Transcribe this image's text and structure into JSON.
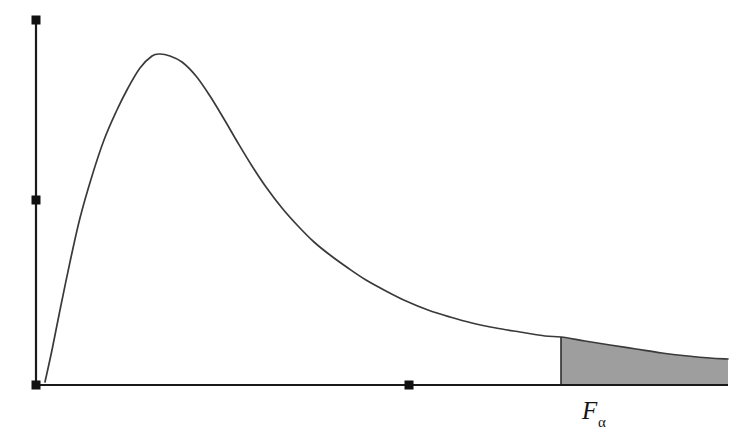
{
  "figure": {
    "name": "f-distribution-critical-region",
    "background_color": "#ffffff",
    "axis_color": "#1a1a1a",
    "curve_color": "#3a3a3a",
    "shade_color": "#9e9e9e"
  },
  "labels": {
    "critical_value_symbol": "F",
    "critical_value_subscript": "α"
  },
  "chart_data": {
    "type": "line",
    "title": "",
    "xlabel": "",
    "ylabel": "",
    "grid": false,
    "legend": null,
    "xlim": [
      0,
      692
    ],
    "ylim": [
      0,
      365
    ],
    "axis_markers": {
      "y_axis": [
        {
          "name": "y-axis-top-marker",
          "x": 36,
          "y": 20
        },
        {
          "name": "y-axis-mid-marker",
          "x": 36,
          "y": 200
        },
        {
          "name": "origin-marker",
          "x": 36,
          "y": 385
        }
      ],
      "x_axis": [
        {
          "name": "x-axis-mid-marker",
          "x": 409,
          "y": 385
        }
      ]
    },
    "series": [
      {
        "name": "f-density",
        "points": [
          [
            45,
            382
          ],
          [
            52,
            350
          ],
          [
            60,
            310
          ],
          [
            70,
            262
          ],
          [
            80,
            218
          ],
          [
            92,
            176
          ],
          [
            104,
            140
          ],
          [
            116,
            112
          ],
          [
            128,
            88
          ],
          [
            140,
            68
          ],
          [
            152,
            56
          ],
          [
            160,
            54
          ],
          [
            170,
            56
          ],
          [
            182,
            62
          ],
          [
            196,
            76
          ],
          [
            210,
            96
          ],
          [
            224,
            119
          ],
          [
            238,
            143
          ],
          [
            252,
            166
          ],
          [
            266,
            187
          ],
          [
            282,
            208
          ],
          [
            298,
            226
          ],
          [
            314,
            242
          ],
          [
            330,
            255
          ],
          [
            348,
            268
          ],
          [
            366,
            280
          ],
          [
            386,
            291
          ],
          [
            406,
            301
          ],
          [
            428,
            310
          ],
          [
            450,
            317
          ],
          [
            472,
            323
          ],
          [
            496,
            328
          ],
          [
            520,
            332
          ],
          [
            545,
            336
          ],
          [
            561,
            337
          ],
          [
            585,
            341
          ],
          [
            610,
            345
          ],
          [
            636,
            349
          ],
          [
            662,
            353
          ],
          [
            688,
            356
          ],
          [
            710,
            358
          ],
          [
            728,
            359
          ]
        ]
      }
    ],
    "shaded_region": {
      "name": "critical-region-alpha",
      "x_start": 561,
      "x_end": 728,
      "baseline_y": 385,
      "fill": "#9e9e9e",
      "label": "F_alpha"
    },
    "axes": {
      "y_axis": {
        "x": 36,
        "y_top": 20,
        "y_bottom": 385
      },
      "x_axis": {
        "y": 385,
        "x_left": 36,
        "x_right": 728
      }
    }
  }
}
